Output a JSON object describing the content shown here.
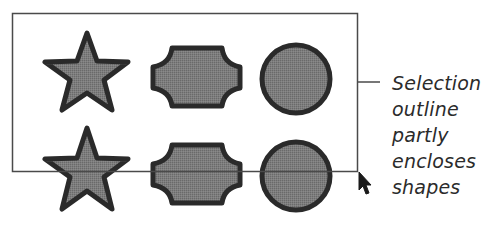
{
  "figure": {
    "colors": {
      "background": "#ffffff",
      "shape_fill": "#7a7a7a",
      "shape_stroke": "#2a2a2a",
      "selection_outline": "#4a4a4a",
      "text": "#2b2b2b",
      "cursor": "#1a1a1a"
    },
    "selection_rect": {
      "x": 12,
      "y": 13,
      "width": 345,
      "height": 158
    },
    "rows": [
      {
        "shapes": [
          "star",
          "notched-octagon",
          "circle"
        ],
        "y_center": 75,
        "fully_inside": true
      },
      {
        "shapes": [
          "star",
          "notched-octagon",
          "circle"
        ],
        "y_center": 174,
        "fully_inside": false
      }
    ],
    "cursor": {
      "icon": "arrow-cursor-icon",
      "x": 360,
      "y": 175
    }
  },
  "callout": {
    "lines": [
      "Selection",
      "outline",
      "partly",
      "encloses",
      "shapes"
    ]
  }
}
